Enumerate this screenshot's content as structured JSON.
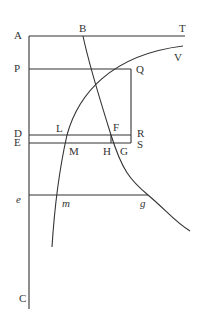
{
  "diagram": {
    "type": "geometric-figure",
    "labels": {
      "A": "A",
      "B": "B",
      "T": "T",
      "V": "V",
      "P": "P",
      "Q": "Q",
      "D": "D",
      "L": "L",
      "F": "F",
      "R": "R",
      "E": "E",
      "M": "M",
      "H": "H",
      "G": "G",
      "S": "S",
      "e": "e",
      "m": "m",
      "g": "g",
      "C": "C"
    },
    "stroke_color": "#333333"
  }
}
